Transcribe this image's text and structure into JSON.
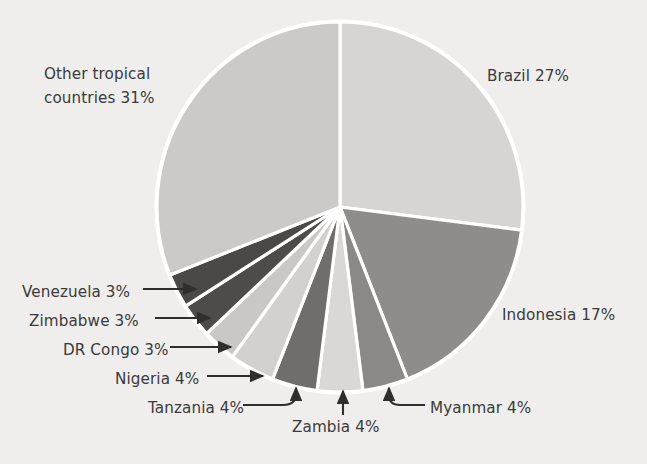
{
  "background_color": "#efeeec",
  "chart_data": {
    "type": "pie",
    "title": "",
    "subtitle": "",
    "xlabel": "",
    "ylabel": "",
    "legend_position": "none",
    "grid": false,
    "units": "percent",
    "start_angle_deg": 0,
    "direction": "clockwise",
    "categories": [
      "Brazil",
      "Indonesia",
      "Myanmar",
      "Zambia",
      "Tanzania",
      "Nigeria",
      "DR Congo",
      "Zimbabwe",
      "Venezuela",
      "Other tropical countries"
    ],
    "values": [
      27,
      17,
      4,
      4,
      4,
      4,
      3,
      3,
      3,
      31
    ],
    "slice_colors": [
      "#d6d5d3",
      "#8e8d8b",
      "#8a8987",
      "#d9d8d6",
      "#6f6e6c",
      "#d2d1cf",
      "#c9c8c6",
      "#4d4c4a",
      "#4a4947",
      "#cbcac8"
    ],
    "separator_color": "#ffffff",
    "slices": [
      {
        "name": "Brazil",
        "value": 27,
        "color": "#d6d5d3",
        "label": "Brazil 27%"
      },
      {
        "name": "Indonesia",
        "value": 17,
        "color": "#8e8d8b",
        "label": "Indonesia 17%"
      },
      {
        "name": "Myanmar",
        "value": 4,
        "color": "#8a8987",
        "label": "Myanmar 4%"
      },
      {
        "name": "Zambia",
        "value": 4,
        "color": "#d9d8d6",
        "label": "Zambia 4%"
      },
      {
        "name": "Tanzania",
        "value": 4,
        "color": "#6f6e6c",
        "label": "Tanzania 4%"
      },
      {
        "name": "Nigeria",
        "value": 4,
        "color": "#d2d1cf",
        "label": "Nigeria 4%"
      },
      {
        "name": "DR Congo",
        "value": 3,
        "color": "#c9c8c6",
        "label": "DR Congo 3%"
      },
      {
        "name": "Zimbabwe",
        "value": 3,
        "color": "#4d4c4a",
        "label": "Zimbabwe 3%"
      },
      {
        "name": "Venezuela",
        "value": 3,
        "color": "#4a4947",
        "label": "Venezuela 3%"
      },
      {
        "name": "Other tropical countries",
        "value": 31,
        "color": "#cbcac8",
        "label": "Other tropical\ncountries  31%"
      }
    ]
  },
  "labels": {
    "brazil": "Brazil 27%",
    "indonesia": "Indonesia 17%",
    "other": "Other tropical\ncountries  31%",
    "venezuela": "Venezuela 3%",
    "zimbabwe": "Zimbabwe 3%",
    "dr_congo": "DR Congo 3%",
    "nigeria": "Nigeria 4%",
    "tanzania": "Tanzania 4%",
    "zambia": "Zambia 4%",
    "myanmar": "Myanmar 4%"
  }
}
